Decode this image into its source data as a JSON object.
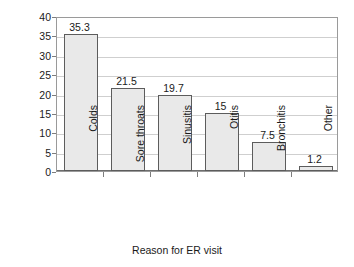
{
  "chart_data": {
    "type": "bar",
    "title": "",
    "xlabel": "Reason for ER visit",
    "ylabel": "Percentage of visits",
    "categories": [
      "Colds",
      "Sore throats",
      "Sinusitis",
      "Otitis",
      "Bronchitis",
      "Other"
    ],
    "values": [
      35.3,
      21.5,
      19.7,
      15,
      7.5,
      1.2
    ],
    "value_labels": [
      "35.3",
      "21.5",
      "19.7",
      "15",
      "7.5",
      "1.2"
    ],
    "ylim": [
      0,
      40
    ],
    "ytick_step": 5,
    "ytick_labels": [
      "0",
      "5",
      "10",
      "15",
      "20",
      "25",
      "30",
      "35",
      "40"
    ],
    "grid": "horizontal",
    "legend": "none",
    "bar_fill_color": "#e9e9e9",
    "bar_border_color": "#5c5c5c",
    "gridline_color": "#cfcfcf",
    "frame_color": "#9a9a9a",
    "background_color": "#ffffff",
    "text_color": "#1a1a1a",
    "label_rotation_deg": -90
  }
}
